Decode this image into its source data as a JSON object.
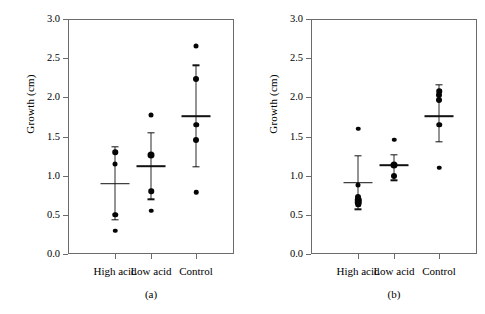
{
  "figure": {
    "ylabel": "Growth (cm)",
    "y_ticks": [
      "0.0",
      "0.5",
      "1.0",
      "1.5",
      "2.0",
      "2.5",
      "3.0"
    ],
    "x_categories": [
      "High acid",
      "Low acid",
      "Control"
    ],
    "captions": [
      "(a)",
      "(b)"
    ],
    "axis_color": "#6b6b6b",
    "marker_color": "#050505"
  },
  "chart_data": [
    {
      "type": "scatter",
      "title": "(a)",
      "xlabel": "",
      "ylabel": "Growth (cm)",
      "ylim": [
        0.0,
        3.0
      ],
      "yticks": [
        0.0,
        0.5,
        1.0,
        1.5,
        2.0,
        2.5,
        3.0
      ],
      "grid": false,
      "legend": "none",
      "categories": [
        "High acid",
        "Low acid",
        "Control"
      ],
      "groups": [
        {
          "name": "High acid",
          "points": [
            1.3,
            1.15,
            0.5,
            0.3
          ],
          "point_sizes": [
            5.5,
            5.0,
            5.5,
            4.5
          ],
          "mean": 0.9,
          "error_high": 1.37,
          "error_low": 0.44
        },
        {
          "name": "Low acid",
          "points": [
            1.78,
            1.26,
            0.8,
            0.55
          ],
          "point_sizes": [
            5.0,
            7.0,
            5.5,
            4.5
          ],
          "mean": 1.12,
          "error_high": 1.55,
          "error_low": 0.7
        },
        {
          "name": "Control",
          "points": [
            2.66,
            2.24,
            1.65,
            1.45,
            0.79
          ],
          "point_sizes": [
            5.0,
            6.0,
            5.5,
            6.0,
            4.5
          ],
          "mean": 1.76,
          "error_high": 2.41,
          "error_low": 1.11
        }
      ]
    },
    {
      "type": "scatter",
      "title": "(b)",
      "xlabel": "",
      "ylabel": "Growth (cm)",
      "ylim": [
        0.0,
        3.0
      ],
      "yticks": [
        0.0,
        0.5,
        1.0,
        1.5,
        2.0,
        2.5,
        3.0
      ],
      "grid": false,
      "legend": "none",
      "categories": [
        "High acid",
        "Low acid",
        "Control"
      ],
      "groups": [
        {
          "name": "High acid",
          "points": [
            1.6,
            0.88,
            0.73,
            0.69,
            0.66,
            0.63
          ],
          "point_sizes": [
            4.5,
            5.0,
            6.0,
            6.5,
            6.5,
            5.5
          ],
          "mean": 0.91,
          "error_high": 1.25,
          "error_low": 0.57
        },
        {
          "name": "Low acid",
          "points": [
            1.46,
            1.13,
            1.0
          ],
          "point_sizes": [
            4.5,
            7.0,
            6.0
          ],
          "mean": 1.13,
          "error_high": 1.27,
          "error_low": 0.94
        },
        {
          "name": "Control",
          "points": [
            2.08,
            2.03,
            1.96,
            1.65,
            1.1
          ],
          "point_sizes": [
            5.5,
            6.0,
            6.0,
            5.5,
            4.5
          ],
          "mean": 1.76,
          "error_high": 2.16,
          "error_low": 1.43
        }
      ]
    }
  ]
}
